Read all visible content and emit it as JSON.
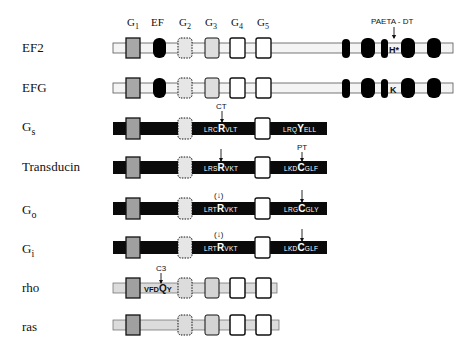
{
  "figure": {
    "colors": {
      "light_bar": "#f2f2f2",
      "light_bar_rho": "#dcdcdc",
      "dark_bar": "#0a0a0a",
      "g1_fill": "#a8a8a8",
      "g2_fill": "#e4e4e4",
      "g3_fill": "#dedede",
      "g45_fill": "#ffffff",
      "blob_fill": "#000000",
      "outline": "#111111"
    },
    "column_headers": [
      {
        "id": "g1",
        "main": "G",
        "sub": "1",
        "x": 133
      },
      {
        "id": "ef",
        "main": "EF",
        "sub": "",
        "x": 159
      },
      {
        "id": "g2",
        "main": "G",
        "sub": "2",
        "x": 185
      },
      {
        "id": "g3",
        "main": "G",
        "sub": "3",
        "x": 212
      },
      {
        "id": "g4",
        "main": "G",
        "sub": "4",
        "x": 237
      },
      {
        "id": "g5",
        "main": "G",
        "sub": "5",
        "x": 263
      }
    ],
    "rows": [
      {
        "id": "ef2",
        "label": "EF2",
        "label_sub": "",
        "y": 48,
        "bar": "light",
        "bar_end": 453,
        "ef_blob": true,
        "right_blobs": true,
        "mid_residue": "H*"
      },
      {
        "id": "efg",
        "label": "EFG",
        "label_sub": "",
        "y": 88,
        "bar": "light",
        "bar_end": 453,
        "ef_blob": true,
        "right_blobs": true,
        "mid_residue": "K"
      },
      {
        "id": "gs",
        "label": "G",
        "label_sub": "s",
        "y": 128,
        "bar": "dark",
        "bar_end": 327,
        "ef_blob": false,
        "right_blobs": false
      },
      {
        "id": "transducin",
        "label": "Transducin",
        "label_sub": "",
        "y": 167,
        "bar": "dark",
        "bar_end": 327,
        "ef_blob": false,
        "right_blobs": false
      },
      {
        "id": "go",
        "label": "G",
        "label_sub": "o",
        "y": 211,
        "bar": "dark",
        "bar_end": 327,
        "ef_blob": false,
        "right_blobs": false
      },
      {
        "id": "gi",
        "label": "G",
        "label_sub": "i",
        "y": 250,
        "bar": "dark",
        "bar_end": 327,
        "ef_blob": false,
        "right_blobs": false
      },
      {
        "id": "rho",
        "label": "rho",
        "label_sub": "",
        "y": 288,
        "bar": "rho",
        "bar_end": 277,
        "ef_blob": false,
        "right_blobs": false
      },
      {
        "id": "ras",
        "label": "ras",
        "label_sub": "",
        "y": 325,
        "bar": "rho",
        "bar_end": 279,
        "ef_blob": false,
        "right_blobs": false
      }
    ],
    "sequences": {
      "gs_mid": {
        "pre": "LRC",
        "key": "R",
        "post": "VLT"
      },
      "gs_end": {
        "pre": "LRQ",
        "key": "Y",
        "post": "ELL"
      },
      "transducin_mid": {
        "pre": "LRS",
        "key": "R",
        "post": "VKT"
      },
      "transducin_end": {
        "pre": "LKD",
        "key": "C",
        "post": "GLF"
      },
      "go_mid": {
        "pre": "LRT",
        "key": "R",
        "post": "VKT"
      },
      "go_end": {
        "pre": "LRG",
        "key": "C",
        "post": "GLY"
      },
      "gi_mid": {
        "pre": "LRT",
        "key": "R",
        "post": "VKT"
      },
      "gi_end": {
        "pre": "LKD",
        "key": "C",
        "post": "GLF"
      },
      "rho_seq": {
        "pre": "VFD",
        "key": "Q",
        "post": "Y"
      }
    },
    "annotations": {
      "paeta_dt": "PAETA - DT",
      "ct": "CT",
      "pt": "PT",
      "c3": "C3",
      "paren_arrow": "(↓)"
    }
  }
}
